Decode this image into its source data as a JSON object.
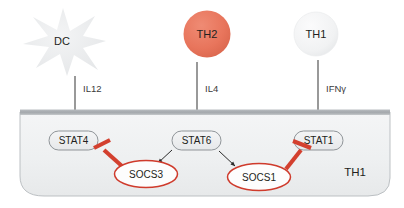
{
  "figure": {
    "compartment_label": "TH1",
    "colors": {
      "th2_fill": "#e8755c",
      "th1_fill": "#f1f2f2",
      "dc_fill": "#e9eaec",
      "inhibitor_red": "#d3402f",
      "socs_outline": "#cf3b2c",
      "stat_fill": "#eceef0",
      "stat_stroke": "#8a8f94",
      "cell_fill": "#eff1f2",
      "cell_stroke": "#b6babd",
      "membrane": "#a9adb1",
      "arrow_dark": "#2b2b2b",
      "text_dark": "#231f20"
    }
  },
  "source_cells": [
    {
      "id": "dc",
      "label": "DC",
      "shape": "star",
      "fill": "#e9eaec"
    },
    {
      "id": "th2",
      "label": "TH2",
      "shape": "circle",
      "fill": "#e8755c"
    },
    {
      "id": "th1",
      "label": "TH1",
      "shape": "circle",
      "fill": "#f1f2f2"
    }
  ],
  "cytokines": [
    {
      "id": "il12",
      "label": "IL12",
      "from": "dc",
      "to": "stat4"
    },
    {
      "id": "il4",
      "label": "IL4",
      "from": "th2",
      "to": "stat6"
    },
    {
      "id": "ifng",
      "label": "IFNγ",
      "from": "th1",
      "to": "stat1"
    }
  ],
  "stats": [
    {
      "id": "stat4",
      "label": "STAT4"
    },
    {
      "id": "stat6",
      "label": "STAT6"
    },
    {
      "id": "stat1",
      "label": "STAT1"
    }
  ],
  "socs": [
    {
      "id": "socs3",
      "label": "SOCS3",
      "activated_by": "STAT6",
      "inhibits": "STAT4"
    },
    {
      "id": "socs1",
      "label": "SOCS1",
      "activated_by": "STAT6",
      "inhibits": "STAT1"
    }
  ],
  "relations": [
    {
      "type": "activation",
      "source": "STAT6",
      "target": "SOCS3",
      "glyph": "arrow"
    },
    {
      "type": "activation",
      "source": "STAT6",
      "target": "SOCS1",
      "glyph": "arrow"
    },
    {
      "type": "inhibition",
      "source": "SOCS3",
      "target": "STAT4",
      "glyph": "t-bar"
    },
    {
      "type": "inhibition",
      "source": "SOCS1",
      "target": "STAT1",
      "glyph": "t-bar"
    },
    {
      "type": "signal",
      "source": "DC",
      "target": "STAT4",
      "glyph": "arrow"
    },
    {
      "type": "signal",
      "source": "TH2",
      "target": "STAT6",
      "glyph": "arrow"
    },
    {
      "type": "signal",
      "source": "TH1",
      "target": "STAT1",
      "glyph": "arrow"
    }
  ]
}
